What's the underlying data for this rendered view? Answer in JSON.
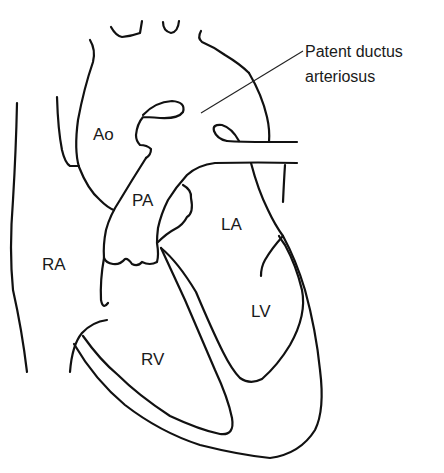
{
  "diagram": {
    "labels": {
      "ao": "Ao",
      "pa": "PA",
      "la": "LA",
      "ra": "RA",
      "lv": "LV",
      "rv": "RV"
    },
    "callout": {
      "line1": "Patent ductus",
      "line2": "arteriosus"
    },
    "colors": {
      "stroke": "#111111",
      "background": "#ffffff"
    }
  }
}
